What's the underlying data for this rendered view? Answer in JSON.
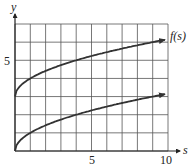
{
  "chart_data": {
    "type": "line",
    "title": "",
    "xlabel": "s",
    "ylabel": "y",
    "xlim": [
      0,
      10
    ],
    "ylim": [
      0,
      7
    ],
    "grid": true,
    "x_ticks": [
      5,
      10
    ],
    "y_ticks": [
      5
    ],
    "x_tick_labels": [
      "5",
      "10"
    ],
    "y_tick_labels": [
      "5"
    ],
    "series": [
      {
        "name": "f(s)",
        "label": "f(s)",
        "x": [
          0,
          0.25,
          1,
          2,
          4,
          6,
          9,
          9.8
        ],
        "values": [
          3,
          3.5,
          4,
          4.41,
          5,
          5.45,
          6,
          6.13
        ]
      },
      {
        "name": "lower curve",
        "label": "",
        "x": [
          0,
          0.25,
          1,
          2,
          4,
          6,
          9,
          9.8
        ],
        "values": [
          0,
          0.5,
          1,
          1.41,
          2,
          2.45,
          3,
          3.13
        ]
      }
    ]
  },
  "labels": {
    "y_axis": "y",
    "x_axis": "s",
    "tick_y5": "5",
    "tick_x5": "5",
    "tick_x10": "10",
    "curve_label": "f(s)"
  }
}
